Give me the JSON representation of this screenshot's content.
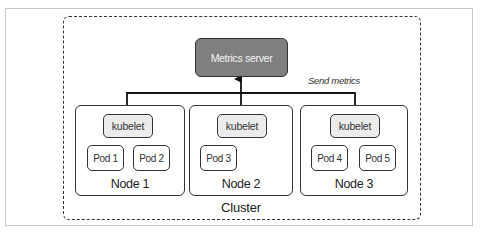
{
  "diagram": {
    "title": "",
    "metrics_server": {
      "label": "Metrics server",
      "fill": "#7f7f7f",
      "text_color": "#f4f4f4"
    },
    "edge_label": "Send metrics",
    "cluster": {
      "label": "Cluster",
      "border_style": "dashed"
    },
    "nodes": [
      {
        "label": "Node 1",
        "kubelet": "kubelet",
        "pods": [
          "Pod 1",
          "Pod 2"
        ]
      },
      {
        "label": "Node 2",
        "kubelet": "kubelet",
        "pods": [
          "Pod 3"
        ]
      },
      {
        "label": "Node 3",
        "kubelet": "kubelet",
        "pods": [
          "Pod 4",
          "Pod 5"
        ]
      }
    ],
    "edges": [
      {
        "from": "Node 1 kubelet",
        "to": "Metrics server"
      },
      {
        "from": "Node 2 kubelet",
        "to": "Metrics server"
      },
      {
        "from": "Node 3 kubelet",
        "to": "Metrics server"
      }
    ],
    "colors": {
      "kubelet_fill": "#ececec",
      "pod_fill": "#ffffff",
      "stroke": "#333333",
      "frame": "#c8c8c8"
    }
  }
}
